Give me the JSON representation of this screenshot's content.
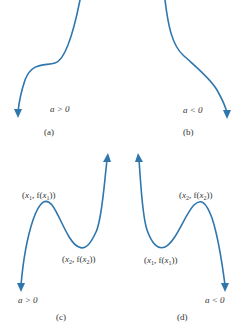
{
  "colors": {
    "curve": "#2f76ad",
    "text": "#333333",
    "background": "#ffffff"
  },
  "panels": [
    {
      "id": "a",
      "caption": "(a)",
      "condition": "a > 0"
    },
    {
      "id": "b",
      "caption": "(b)",
      "condition": "a < 0"
    },
    {
      "id": "c",
      "caption": "(c)",
      "condition": "a > 0",
      "max_label": {
        "x": "x",
        "sub": "1",
        "mid": ", f(",
        "x2": "x",
        "sub2": "1",
        "end": "))"
      },
      "min_label": {
        "x": "x",
        "sub": "2",
        "mid": ", f(",
        "x2": "x",
        "sub2": "2",
        "end": "))"
      }
    },
    {
      "id": "d",
      "caption": "(d)",
      "condition": "a < 0",
      "max_label": {
        "x": "x",
        "sub": "2",
        "mid": ", f(",
        "x2": "x",
        "sub2": "2",
        "end": "))"
      },
      "min_label": {
        "x": "x",
        "sub": "1",
        "mid": ", f(",
        "x2": "x",
        "sub2": "1",
        "end": "))"
      }
    }
  ]
}
